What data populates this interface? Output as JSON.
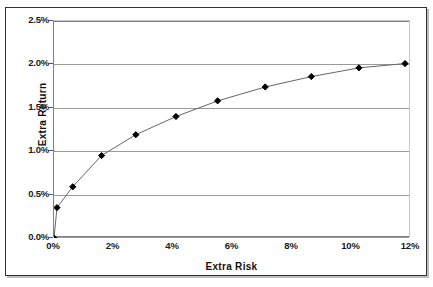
{
  "chart_data": {
    "type": "line",
    "title": "",
    "subtitle": "",
    "xlabel": "Extra Risk",
    "ylabel": "Extra Return",
    "xlim": [
      0,
      12
    ],
    "ylim": [
      0,
      2.5
    ],
    "xticks": [
      "0%",
      "2%",
      "4%",
      "6%",
      "8%",
      "10%",
      "12%"
    ],
    "xtick_values": [
      0,
      2,
      4,
      6,
      8,
      10,
      12
    ],
    "yticks": [
      "0.0%",
      "0.5%",
      "1.0%",
      "1.5%",
      "2.0%",
      "2.5%"
    ],
    "ytick_values": [
      0,
      0.5,
      1.0,
      1.5,
      2.0,
      2.5
    ],
    "grid": "horizontal",
    "legend": "none",
    "series": [
      {
        "name": "Extra Return vs Extra Risk",
        "marker": "diamond",
        "color": "#000000",
        "line_color": "#666666",
        "x": [
          0.0,
          0.1,
          0.63,
          1.6,
          2.75,
          4.1,
          5.5,
          7.1,
          8.65,
          10.25,
          11.8
        ],
        "y": [
          0.0,
          0.35,
          0.59,
          0.95,
          1.19,
          1.4,
          1.58,
          1.74,
          1.86,
          1.96,
          2.01
        ]
      }
    ],
    "points": [
      {
        "x": 0.0,
        "y": 0.0
      },
      {
        "x": 0.1,
        "y": 0.35
      },
      {
        "x": 0.63,
        "y": 0.59
      },
      {
        "x": 1.6,
        "y": 0.95
      },
      {
        "x": 2.75,
        "y": 1.19
      },
      {
        "x": 4.1,
        "y": 1.4
      },
      {
        "x": 5.5,
        "y": 1.58
      },
      {
        "x": 7.1,
        "y": 1.74
      },
      {
        "x": 8.65,
        "y": 1.86
      },
      {
        "x": 10.25,
        "y": 1.96
      },
      {
        "x": 11.8,
        "y": 2.01
      }
    ],
    "colors": {
      "line": "#666666",
      "marker": "#000000",
      "gridline": "#9a9a9a",
      "axis": "#808080",
      "frame": "#333333",
      "text": "#111111",
      "background": "#ffffff"
    }
  }
}
